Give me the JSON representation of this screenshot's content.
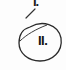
{
  "document": {
    "items": [
      {
        "label": "I.",
        "marked": false
      },
      {
        "label": "II.",
        "marked": true,
        "mark": "circled"
      }
    ]
  },
  "colors": {
    "paper": "#fdfdfd",
    "ink": "#1a1a1a",
    "pencil": "#333333"
  }
}
